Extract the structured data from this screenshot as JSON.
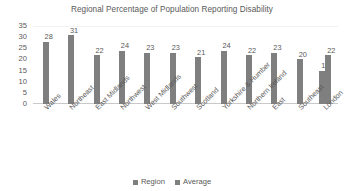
{
  "chart_data": {
    "type": "bar",
    "title": "Regional Percentage of Population Reporting Disability",
    "xlabel": "",
    "ylabel": "",
    "ylim": [
      0,
      35
    ],
    "yticks": [
      0,
      5,
      10,
      15,
      20,
      25,
      30,
      35
    ],
    "grid": false,
    "legend_position": "bottom",
    "categories": [
      "Wales",
      "Northeast",
      "East Midlands",
      "Northwest",
      "West Midlands",
      "Southwest",
      "Scotland",
      "Yorkshire & Humber",
      "Northern Ireland",
      "East",
      "Southeast",
      "London"
    ],
    "series": [
      {
        "name": "Region",
        "color": "#7f7f7f",
        "values": [
          28,
          31,
          22,
          24,
          23,
          23,
          21,
          24,
          22,
          23,
          20,
          15
        ]
      },
      {
        "name": "Average",
        "color": "#7f7f7f",
        "values": [
          null,
          null,
          null,
          null,
          null,
          null,
          null,
          null,
          null,
          null,
          null,
          22
        ]
      }
    ],
    "data_labels": [
      "28",
      "31",
      "22",
      "24",
      "23",
      "23",
      "21",
      "24",
      "22",
      "23",
      "20",
      "15",
      "22"
    ]
  },
  "legend": {
    "items": [
      {
        "label": "Region"
      },
      {
        "label": "Average"
      }
    ]
  }
}
